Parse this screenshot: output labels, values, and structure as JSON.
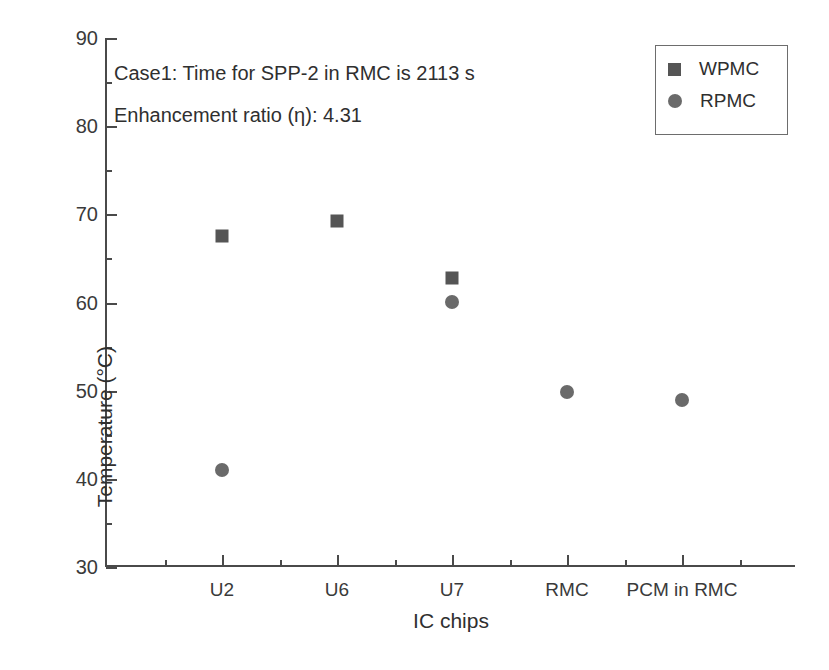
{
  "chart_data": {
    "type": "scatter",
    "title": "",
    "xlabel": "IC chips",
    "ylabel": "Temperature (°C)",
    "categories": [
      "U2",
      "U6",
      "U7",
      "RMC",
      "PCM in RMC"
    ],
    "ylim": [
      30,
      90
    ],
    "yticks": [
      30,
      40,
      50,
      60,
      70,
      80,
      90
    ],
    "ytick_labels": [
      "30",
      "40",
      "50",
      "60",
      "70",
      "80",
      "90"
    ],
    "yminor_ticks": [
      35,
      45,
      55,
      65,
      75,
      85
    ],
    "grid": false,
    "legend_position": "top-right",
    "series": [
      {
        "name": "WPMC",
        "marker": "square",
        "color": "#555555",
        "points": [
          {
            "category": "U2",
            "value": 67.5
          },
          {
            "category": "U6",
            "value": 69.3
          },
          {
            "category": "U7",
            "value": 62.8
          }
        ]
      },
      {
        "name": "RPMC",
        "marker": "circle",
        "color": "#6a6a6a",
        "points": [
          {
            "category": "U2",
            "value": 41.0
          },
          {
            "category": "U7",
            "value": 60.1
          },
          {
            "category": "RMC",
            "value": 49.8
          },
          {
            "category": "PCM in RMC",
            "value": 48.9
          }
        ]
      }
    ],
    "annotations": [
      {
        "text": "Case1: Time for SPP-2 in RMC is 2113 s",
        "x_px": 114,
        "y_px": 62
      },
      {
        "text": "Enhancement ratio (η): 4.31",
        "x_px": 114,
        "y_px": 104
      }
    ]
  },
  "legend": {
    "entries": [
      {
        "label": "WPMC",
        "marker": "square"
      },
      {
        "label": "RPMC",
        "marker": "circle"
      }
    ]
  },
  "colors": {
    "axis": "#4a4a4a",
    "text": "#2f2f2f",
    "wpmc_marker": "#555555",
    "rpmc_marker": "#6a6a6a",
    "background": "#ffffff"
  }
}
